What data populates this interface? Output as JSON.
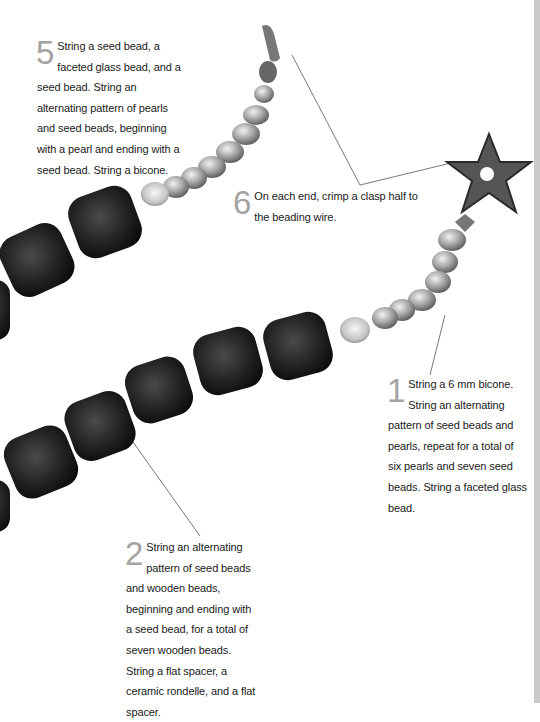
{
  "page": {
    "colors": {
      "background": "#ffffff",
      "text": "#1a1a1a",
      "step_number": "#a3a3a3",
      "edge_stripe": "#c9c9c9",
      "wood_bead": "#1c1c1c",
      "leader_line": "#555555"
    }
  },
  "steps": [
    {
      "id": "step5",
      "number": "5",
      "text": "String a seed bead, a faceted glass bead, and a seed bead. String an alternating pattern of pearls and seed beads, beginning with a pearl and ending with a seed bead. String a bicone."
    },
    {
      "id": "step6",
      "number": "6",
      "text": "On each end, crimp a clasp half to the beading wire."
    },
    {
      "id": "step1",
      "number": "1",
      "text": "String a 6 mm bicone. String an alternating pattern of seed beads and pearls, repeat for a total of six pearls and seven seed beads. String a faceted glass bead."
    },
    {
      "id": "step2",
      "number": "2",
      "text": "String an alternating pattern of seed beads and wooden beads, beginning and ending with a seed bead, for a total of seven wooden beads. String a flat spacer, a ceramic rondelle, and a flat spacer."
    }
  ],
  "photo": {
    "subject": "beaded necklace with wooden beads, pearls, faceted glass beads and a starfish clasp",
    "elements": [
      "wooden-bead",
      "pearl",
      "faceted-glass-bead",
      "bicone",
      "seed-bead",
      "starfish-clasp",
      "lobster-clasp"
    ]
  }
}
